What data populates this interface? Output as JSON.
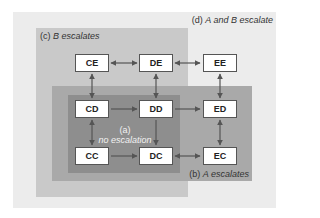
{
  "regions": {
    "d": {
      "tag": "(d)",
      "label": "A and B escalate",
      "color": "#ececec"
    },
    "c": {
      "tag": "(c)",
      "label": "B escalates",
      "color": "#c9c9c9"
    },
    "b": {
      "tag": "(b)",
      "label": "A escalates",
      "color": "#a9a9a9"
    },
    "a": {
      "tag": "(a)",
      "label": "no escalation",
      "color": "#8e8e8e"
    }
  },
  "nodes": {
    "CE": "CE",
    "DE": "DE",
    "EE": "EE",
    "CD": "CD",
    "DD": "DD",
    "ED": "ED",
    "CC": "CC",
    "DC": "DC",
    "EC": "EC"
  },
  "edges": [
    {
      "from": "CE",
      "to": "DE",
      "type": "bidirectional"
    },
    {
      "from": "DE",
      "to": "EE",
      "type": "bidirectional"
    },
    {
      "from": "CD",
      "to": "CE",
      "type": "bidirectional"
    },
    {
      "from": "DD",
      "to": "DE",
      "type": "bidirectional"
    },
    {
      "from": "ED",
      "to": "EE",
      "type": "bidirectional"
    },
    {
      "from": "CD",
      "to": "DD",
      "type": "directed"
    },
    {
      "from": "DD",
      "to": "ED",
      "type": "directed"
    },
    {
      "from": "CD",
      "to": "CC",
      "type": "bidirectional"
    },
    {
      "from": "DD",
      "to": "DC",
      "type": "directed"
    },
    {
      "from": "ED",
      "to": "EC",
      "type": "bidirectional"
    },
    {
      "from": "CC",
      "to": "DC",
      "type": "directed"
    },
    {
      "from": "DC",
      "to": "EC",
      "type": "bidirectional"
    }
  ]
}
